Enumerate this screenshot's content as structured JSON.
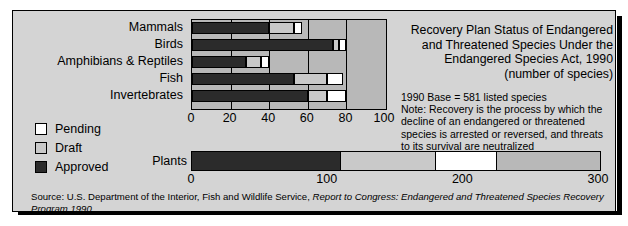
{
  "chart_data": {
    "type": "bar",
    "orientation": "horizontal",
    "stacked": true,
    "title": "Recovery Plan Status of Endangered and Threatened Species Under the Endangered Species Act, 1990",
    "title_lines": [
      "Recovery Plan Status of Endangered",
      "and Threatened Species Under the",
      "Endangered Species Act, 1990",
      "(number of species)"
    ],
    "subtitle": "(number of species)",
    "xlabel": "",
    "ylabel": "",
    "grid": true,
    "legend_position": "left",
    "legend": [
      "Pending",
      "Draft",
      "Approved"
    ],
    "series": [
      {
        "name": "Approved",
        "color": "#2b2b2b",
        "values": [
          40,
          73,
          28,
          53,
          60
        ]
      },
      {
        "name": "Draft",
        "color": "#c9c9c9",
        "values": [
          13,
          3,
          8,
          17,
          10
        ]
      },
      {
        "name": "Pending",
        "color": "#ffffff",
        "values": [
          4,
          4,
          4,
          8,
          10
        ]
      }
    ],
    "categories": [
      "Mammals",
      "Birds",
      "Amphibians & Reptiles",
      "Fish",
      "Invertebrates"
    ],
    "xlim": [
      0,
      100
    ],
    "xticks": [
      0,
      20,
      40,
      60,
      80,
      100
    ],
    "secondary_chart": {
      "type": "bar",
      "orientation": "horizontal",
      "stacked": true,
      "categories": [
        "Plants"
      ],
      "xlim": [
        0,
        300
      ],
      "xticks": [
        0,
        100,
        200,
        300
      ],
      "series": [
        {
          "name": "Approved",
          "color": "#2b2b2b",
          "values": [
            110
          ]
        },
        {
          "name": "Draft",
          "color": "#c9c9c9",
          "values": [
            70
          ]
        },
        {
          "name": "Pending",
          "color": "#ffffff",
          "values": [
            45
          ]
        }
      ]
    },
    "annotations": [
      "1990 Base = 581 listed species",
      "Note: Recovery is the process by which the",
      "decline of an endangered or threatened",
      "species is arrested or reversed, and threats",
      "to its survival are neutralized"
    ],
    "source_prefix": "Source: U.S. Department of the Interior, Fish and Wildlife Service, ",
    "source_italic": "Report to Congress: Endangered and Threatened Species Recovery Program 1990"
  },
  "colors": {
    "plate_background": "#d4d4d4",
    "plot_background": "#b8b8b8",
    "approved": "#2b2b2b",
    "draft": "#c9c9c9",
    "pending": "#ffffff",
    "outline": "#000000"
  },
  "categories": {
    "mammals": "Mammals",
    "birds": "Birds",
    "amphibians": "Amphibians & Reptiles",
    "fish": "Fish",
    "invertebrates": "Invertebrates",
    "plants": "Plants"
  },
  "legend": {
    "pending": "Pending",
    "draft": "Draft",
    "approved": "Approved"
  },
  "axis_top": {
    "t0": "0",
    "t1": "20",
    "t2": "40",
    "t3": "60",
    "t4": "80",
    "t5": "100"
  },
  "axis_plants": {
    "t0": "0",
    "t1": "100",
    "t2": "200",
    "t3": "300"
  },
  "title": {
    "line1": "Recovery Plan Status of Endangered",
    "line2": "and Threatened Species Under the",
    "line3": "Endangered Species Act, 1990",
    "line4": "(number of species)"
  },
  "note": {
    "line1": "1990 Base = 581 listed species",
    "line2": "Note: Recovery is the process by which the",
    "line3": "decline of an endangered or threatened",
    "line4": "species is arrested or reversed, and threats",
    "line5": "to its survival are neutralized"
  },
  "source": {
    "normal": "Source: U.S. Department of the Interior, Fish and Wildlife Service, ",
    "italic": "Report to Congress: Endangered and Threatened Species Recovery Program 1990"
  }
}
